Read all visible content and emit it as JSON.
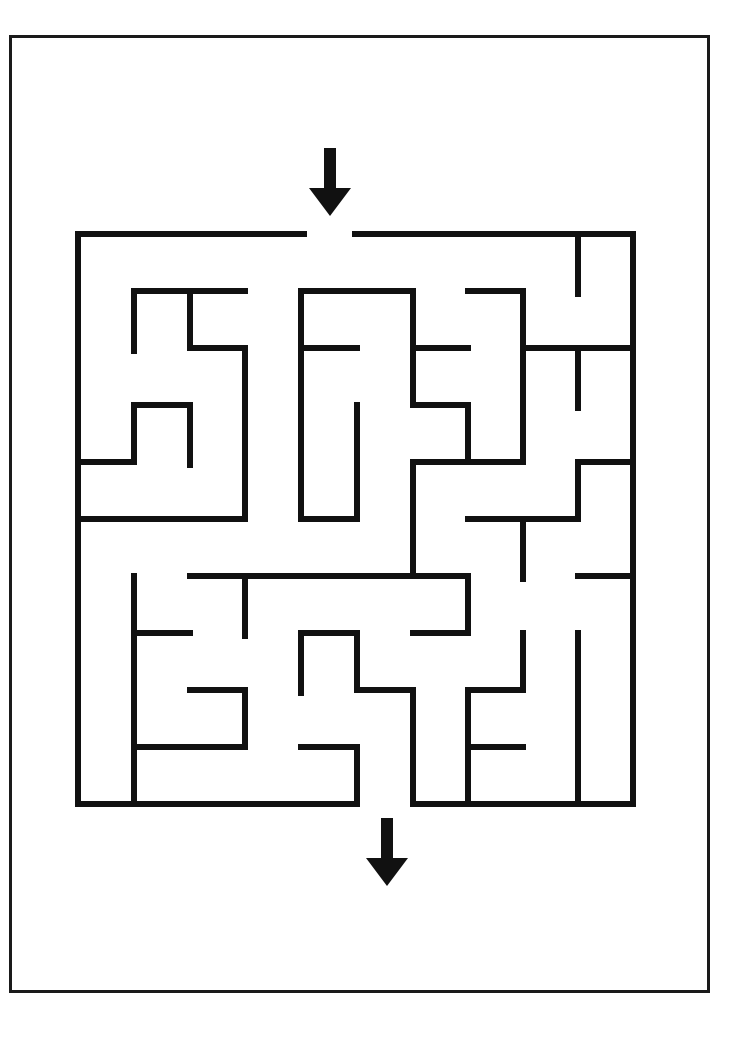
{
  "puzzle": {
    "title": "Maze puzzle",
    "wall_color": "#111111",
    "frame_color": "#1a1a1a",
    "wall_width": 6,
    "start_arrow": {
      "label": "start",
      "x": 330,
      "y_top": 148,
      "y_tip": 216
    },
    "end_arrow": {
      "label": "finish",
      "x": 387,
      "y_top": 818,
      "y_tip": 886
    },
    "grid": {
      "cols": 10,
      "rows": 10,
      "x": [
        78,
        134,
        190,
        245,
        301,
        357,
        413,
        468,
        523,
        578,
        633
      ],
      "y": [
        234,
        291,
        348,
        405,
        462,
        519,
        576,
        633,
        690,
        747,
        804
      ]
    },
    "walls": [
      [
        78,
        234,
        304,
        234
      ],
      [
        355,
        234,
        633,
        234
      ],
      [
        78,
        234,
        78,
        804
      ],
      [
        633,
        234,
        633,
        804
      ],
      [
        78,
        804,
        357,
        804
      ],
      [
        413,
        804,
        633,
        804
      ],
      [
        578,
        234,
        578,
        294
      ],
      [
        134,
        291,
        245,
        291
      ],
      [
        134,
        291,
        134,
        351
      ],
      [
        190,
        291,
        190,
        348
      ],
      [
        190,
        348,
        245,
        348
      ],
      [
        245,
        348,
        245,
        519
      ],
      [
        134,
        405,
        190,
        405
      ],
      [
        134,
        405,
        134,
        462
      ],
      [
        78,
        462,
        134,
        462
      ],
      [
        190,
        405,
        190,
        465
      ],
      [
        78,
        519,
        245,
        519
      ],
      [
        301,
        291,
        413,
        291
      ],
      [
        301,
        291,
        301,
        519
      ],
      [
        301,
        519,
        357,
        519
      ],
      [
        357,
        405,
        357,
        519
      ],
      [
        301,
        348,
        357,
        348
      ],
      [
        413,
        291,
        413,
        405
      ],
      [
        413,
        348,
        468,
        348
      ],
      [
        413,
        405,
        468,
        405
      ],
      [
        468,
        405,
        468,
        462
      ],
      [
        468,
        291,
        523,
        291
      ],
      [
        523,
        291,
        523,
        462
      ],
      [
        413,
        462,
        523,
        462
      ],
      [
        413,
        462,
        413,
        576
      ],
      [
        523,
        348,
        633,
        348
      ],
      [
        578,
        348,
        578,
        408
      ],
      [
        578,
        462,
        633,
        462
      ],
      [
        578,
        462,
        578,
        519
      ],
      [
        468,
        519,
        578,
        519
      ],
      [
        523,
        519,
        523,
        579
      ],
      [
        578,
        576,
        633,
        576
      ],
      [
        190,
        576,
        468,
        576
      ],
      [
        245,
        576,
        245,
        636
      ],
      [
        468,
        576,
        468,
        633
      ],
      [
        413,
        633,
        468,
        633
      ],
      [
        134,
        576,
        134,
        804
      ],
      [
        134,
        633,
        190,
        633
      ],
      [
        190,
        690,
        245,
        690
      ],
      [
        245,
        690,
        245,
        747
      ],
      [
        134,
        747,
        245,
        747
      ],
      [
        301,
        633,
        357,
        633
      ],
      [
        301,
        633,
        301,
        693
      ],
      [
        357,
        633,
        357,
        690
      ],
      [
        357,
        690,
        413,
        690
      ],
      [
        413,
        690,
        413,
        804
      ],
      [
        301,
        747,
        357,
        747
      ],
      [
        357,
        747,
        357,
        804
      ],
      [
        523,
        633,
        523,
        690
      ],
      [
        468,
        690,
        523,
        690
      ],
      [
        468,
        690,
        468,
        804
      ],
      [
        468,
        747,
        523,
        747
      ],
      [
        578,
        633,
        578,
        804
      ]
    ]
  }
}
